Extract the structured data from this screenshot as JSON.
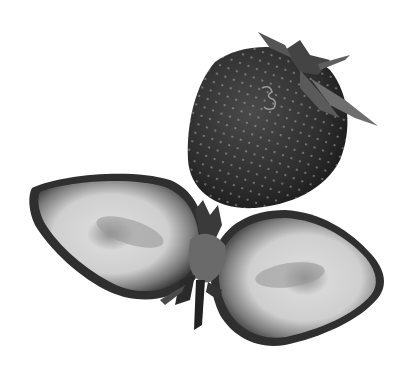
{
  "image": {
    "subject": "strawberries",
    "style": "grayscale photograph",
    "background_color": "#ffffff",
    "objects": [
      {
        "name": "whole-strawberry",
        "description": "whole strawberry with green calyx and stem, upper right"
      },
      {
        "name": "halved-strawberry",
        "description": "strawberry cut lengthwise into two halves, spread apart with calyx in the middle"
      }
    ]
  },
  "colors": {
    "skin_dark": "#2a2a2a",
    "skin_mid": "#3a3a3a",
    "flesh_light": "#e6e6e6",
    "flesh_mid": "#a8a8a8",
    "core": "#8a8a8a",
    "leaf": "#6e6e6e",
    "seed": "#bdbdbd"
  }
}
